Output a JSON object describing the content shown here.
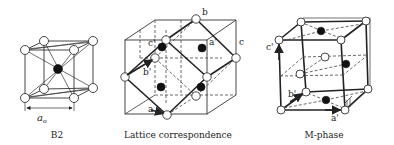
{
  "figure": {
    "panels": [
      {
        "id": "b2",
        "caption": "B2",
        "dimension_label": "a",
        "dimension_subscript": "o"
      },
      {
        "id": "lattice-correspondence",
        "caption": "Lattice correspondence",
        "axis_labels": {
          "b": "b",
          "c": "c",
          "a_prime": "a'",
          "b_prime": "b'",
          "c_prime": "c'",
          "a": "a"
        }
      },
      {
        "id": "m-phase",
        "caption": "M-phase",
        "axis_labels": {
          "a_prime": "a'",
          "b_prime": "b'",
          "c_prime": "c'"
        }
      }
    ],
    "colors": {
      "line": "#333333",
      "atom_white": "#ffffff",
      "atom_black": "#111111"
    }
  }
}
